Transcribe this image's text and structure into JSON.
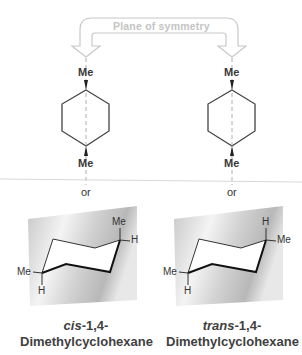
{
  "arrow": {
    "label": "Plane of symmetry",
    "color": "#c8c8c8"
  },
  "left_structure": {
    "top_substituent": "Me",
    "bottom_substituent": "Me",
    "separator": "or",
    "chair": {
      "upper_right_axial": "Me",
      "upper_right_equatorial": "H",
      "lower_left_equatorial": "Me",
      "lower_left_axial": "H"
    },
    "name_prefix": "cis",
    "name_locants": "-1,4-",
    "name_main": "Dimethylcyclohexane"
  },
  "right_structure": {
    "top_substituent": "Me",
    "bottom_substituent": "Me",
    "separator": "or",
    "chair": {
      "upper_right_axial": "H",
      "upper_right_equatorial": "Me",
      "lower_left_equatorial": "Me",
      "lower_left_axial": "H"
    },
    "name_prefix": "trans",
    "name_locants": "-1,4-",
    "name_main": "Dimethylcyclohexane"
  },
  "colors": {
    "line": "#444444",
    "plane_light": "#f2f2f2",
    "plane_dark": "#bdbdbd",
    "divider": "#d8d8d8"
  }
}
